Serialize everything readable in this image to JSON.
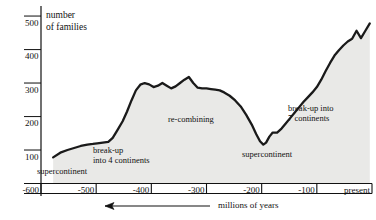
{
  "chart_data": {
    "type": "area",
    "title": "",
    "ylabel_line1": "number",
    "ylabel_line2": "of families",
    "xlabel": "millions of years",
    "x_direction_note": "arrow points left (time increases to the right toward present)",
    "ylim": [
      0,
      530
    ],
    "xlim": [
      -600,
      0
    ],
    "yticks": [
      100,
      200,
      300,
      400,
      500
    ],
    "ytick_labels": [
      "100",
      "200",
      "300",
      "400",
      "500"
    ],
    "xticks": [
      -600,
      -500,
      -400,
      -300,
      -200,
      -100,
      0
    ],
    "xtick_labels": [
      "-600",
      "-500",
      "-400",
      "-300",
      "-200",
      "-100",
      "present"
    ],
    "grid": false,
    "legend": "none",
    "line_color": "#1a1a1a",
    "fill_color": "#e8e8e6",
    "axis_color": "#000000",
    "series": [
      {
        "name": "number of families",
        "x": [
          -578,
          -565,
          -552,
          -540,
          -528,
          -516,
          -506,
          -498,
          -488,
          -478,
          -470,
          -462,
          -452,
          -444,
          -436,
          -428,
          -420,
          -412,
          -404,
          -396,
          -388,
          -380,
          -372,
          -364,
          -356,
          -348,
          -340,
          -332,
          -324,
          -316,
          -308,
          -300,
          -292,
          -284,
          -276,
          -268,
          -258,
          -248,
          -238,
          -228,
          -218,
          -210,
          -203,
          -197,
          -192,
          -186,
          -180,
          -172,
          -164,
          -156,
          -148,
          -140,
          -132,
          -124,
          -116,
          -108,
          -100,
          -92,
          -84,
          -76,
          -68,
          -60,
          -52,
          -44,
          -36,
          -28,
          -20,
          -12,
          -4
        ],
        "y": [
          78,
          92,
          100,
          106,
          112,
          116,
          118,
          120,
          122,
          124,
          136,
          158,
          186,
          215,
          248,
          278,
          295,
          300,
          296,
          288,
          292,
          300,
          292,
          284,
          290,
          300,
          310,
          318,
          300,
          286,
          284,
          284,
          282,
          280,
          278,
          272,
          262,
          248,
          230,
          205,
          176,
          148,
          126,
          116,
          122,
          140,
          152,
          152,
          164,
          180,
          196,
          212,
          228,
          244,
          258,
          272,
          288,
          310,
          336,
          360,
          382,
          398,
          412,
          424,
          432,
          456,
          434,
          456,
          478
        ]
      }
    ],
    "annotations": [
      {
        "id": "supercontinent-1",
        "text": "supercontinent",
        "x_px": 37,
        "y_px": 166
      },
      {
        "id": "breakup-4-line1",
        "text": "break-up",
        "x_px": 93,
        "y_px": 145
      },
      {
        "id": "breakup-4-line2",
        "text": "into 4 continents",
        "x_px": 93,
        "y_px": 155
      },
      {
        "id": "re-combining",
        "text": "re-combining",
        "x_px": 168,
        "y_px": 114
      },
      {
        "id": "supercontinent-2",
        "text": "supercontinent",
        "x_px": 242,
        "y_px": 149
      },
      {
        "id": "breakup-7-line1",
        "text": "break-up into",
        "x_px": 288,
        "y_px": 103
      },
      {
        "id": "breakup-7-line2",
        "text": "7 continents",
        "x_px": 288,
        "y_px": 113
      }
    ]
  },
  "axis": {
    "y_title_line1": "number",
    "y_title_line2": "of families",
    "x_caption": "millions of years"
  }
}
